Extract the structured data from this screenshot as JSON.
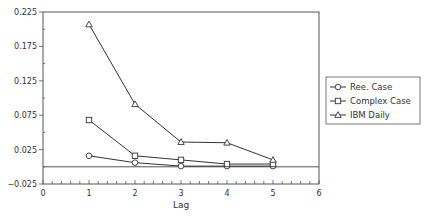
{
  "chart_data": {
    "type": "line",
    "title": "",
    "xlabel": "Lag",
    "ylabel": "",
    "xlim": [
      0,
      6
    ],
    "ylim": [
      -0.025,
      0.225
    ],
    "x_ticks": [
      0,
      1,
      2,
      3,
      4,
      5,
      6
    ],
    "x_tick_labels": [
      "0",
      "1",
      "2",
      "3",
      "4",
      "5",
      "6"
    ],
    "y_ticks": [
      -0.025,
      0.025,
      0.075,
      0.125,
      0.175,
      0.225
    ],
    "y_tick_labels": [
      "-0.025",
      "0.025",
      "0.075",
      "0.125",
      "0.175",
      "0.225"
    ],
    "x_minor_step": 0.2,
    "y_minor_step": 0.025,
    "reference_line_y": 0,
    "grid": false,
    "legend_position": "right",
    "x": [
      1,
      2,
      3,
      4,
      5
    ],
    "series": [
      {
        "name": "Ree. Case",
        "marker": "circle",
        "values": [
          0.016,
          0.006,
          0.001,
          0.001,
          0.001
        ]
      },
      {
        "name": "Complex Case",
        "marker": "square",
        "values": [
          0.068,
          0.016,
          0.01,
          0.004,
          0.004
        ]
      },
      {
        "name": "IBM Daily",
        "marker": "triangle",
        "values": [
          0.207,
          0.091,
          0.036,
          0.035,
          0.01
        ]
      }
    ],
    "colors": {
      "line": "#333333",
      "axis": "#555555",
      "marker_fill": "#ffffff"
    }
  }
}
